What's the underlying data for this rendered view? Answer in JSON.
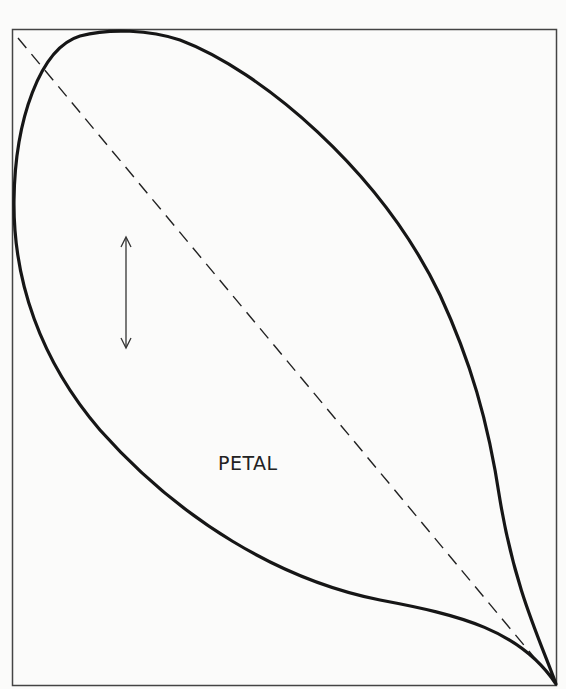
{
  "diagram": {
    "label": "PETAL",
    "colors": {
      "background": "#fbfbfa",
      "stroke": "#1a1a1a",
      "frame": "#444444"
    },
    "elements": [
      "frame",
      "petal-outline",
      "dashed-diagonal",
      "grain-direction-arrow",
      "petal-label"
    ]
  }
}
